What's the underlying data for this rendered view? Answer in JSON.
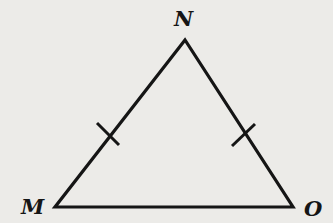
{
  "diagram": {
    "type": "isosceles-triangle",
    "vertices": [
      {
        "label": "N",
        "x": 185,
        "y": 40
      },
      {
        "label": "M",
        "x": 55,
        "y": 207
      },
      {
        "label": "O",
        "x": 293,
        "y": 207
      }
    ],
    "congruent_sides": [
      "MN",
      "NO"
    ],
    "tick_marks": [
      {
        "side": "MN",
        "count": 1
      },
      {
        "side": "NO",
        "count": 1
      }
    ],
    "colors": {
      "background": "#ecebe8",
      "stroke": "#151515"
    }
  },
  "labels": {
    "N": "N",
    "M": "M",
    "O": "O"
  }
}
